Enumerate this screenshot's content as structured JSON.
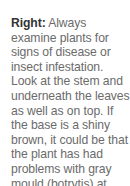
{
  "caption": {
    "lead": "Right:",
    "body": " Always examine plants for signs of disease or insect infestation. Look at the stem and underneath the leaves as well as on top. If the base is a shiny brown, it could be that the plant has had problems with gray mould (botrytis) at some stage."
  },
  "colors": {
    "lead": "#333333",
    "body": "#6b6b6b",
    "background": "#ffffff"
  }
}
